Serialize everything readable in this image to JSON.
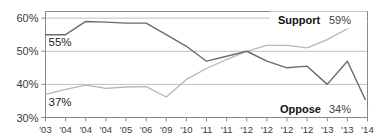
{
  "chart_data": {
    "type": "line",
    "title": "",
    "subtitle": "",
    "xlabel": "",
    "ylabel": "",
    "ylim": [
      30,
      62
    ],
    "yticks": [
      30,
      40,
      50,
      60
    ],
    "ytick_labels": [
      "30%",
      "40%",
      "50%",
      "60%"
    ],
    "grid": true,
    "grid_axis": "y",
    "legend_position": "inline-right",
    "x": [
      "'03",
      "'04",
      "'04",
      "'04",
      "'05",
      "'06",
      "'09",
      "'10",
      "'11",
      "'11",
      "'12",
      "'12",
      "'12",
      "'12",
      "'13",
      "'13",
      "'14"
    ],
    "series": [
      {
        "name": "Support",
        "color": "#b6b6b6",
        "end_label": "Support",
        "end_value_label": "59%",
        "start_value_label": "37%",
        "values": [
          37,
          38.5,
          39.8,
          38.8,
          39.2,
          39.3,
          36.2,
          41.5,
          44.8,
          47.5,
          50.0,
          51.8,
          51.8,
          51.0,
          53.5,
          56.8,
          59
        ]
      },
      {
        "name": "Oppose",
        "color": "#6b6b6b",
        "end_label": "Oppose",
        "end_value_label": "34%",
        "start_value_label": "55%",
        "values": [
          55,
          55,
          59,
          58.8,
          58.5,
          58.5,
          55.0,
          51.5,
          47.0,
          48.5,
          50.0,
          47.0,
          45.0,
          45.5,
          40.0,
          47.0,
          34
        ]
      }
    ],
    "annotations": [
      {
        "text": "55%",
        "series": "Oppose",
        "at": "start"
      },
      {
        "text": "37%",
        "series": "Support",
        "at": "start"
      }
    ],
    "colors": {
      "support_line": "#b6b6b6",
      "oppose_line": "#6b6b6b",
      "gridline": "#b0b0b0",
      "frame": "#8a8a8a",
      "axis_text": "#3a3a3a",
      "label_text": "#1d1d1d",
      "background": "#ffffff"
    }
  }
}
